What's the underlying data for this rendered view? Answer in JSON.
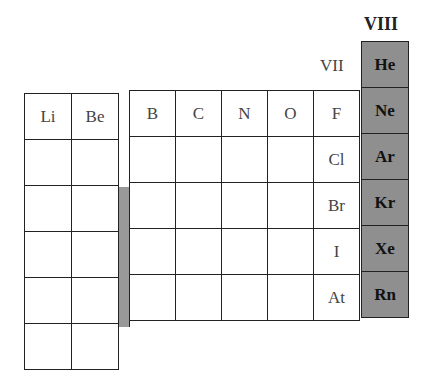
{
  "group_labels": {
    "vii": "VII",
    "viii": "VIII"
  },
  "left_block": {
    "rows": [
      [
        "Li",
        "Be"
      ],
      [
        "",
        ""
      ],
      [
        "",
        ""
      ],
      [
        "",
        ""
      ],
      [
        "",
        ""
      ],
      [
        "",
        ""
      ]
    ]
  },
  "right_block": {
    "rows": [
      [
        "B",
        "C",
        "N",
        "O",
        "F"
      ],
      [
        "",
        "",
        "",
        "",
        "Cl"
      ],
      [
        "",
        "",
        "",
        "",
        "Br"
      ],
      [
        "",
        "",
        "",
        "",
        "I"
      ],
      [
        "",
        "",
        "",
        "",
        "At"
      ]
    ]
  },
  "noble_gases": [
    "He",
    "Ne",
    "Ar",
    "Kr",
    "Xe",
    "Rn"
  ],
  "colors": {
    "highlight": "#8f8f8f",
    "strip": "#999999",
    "border": "#222222"
  }
}
